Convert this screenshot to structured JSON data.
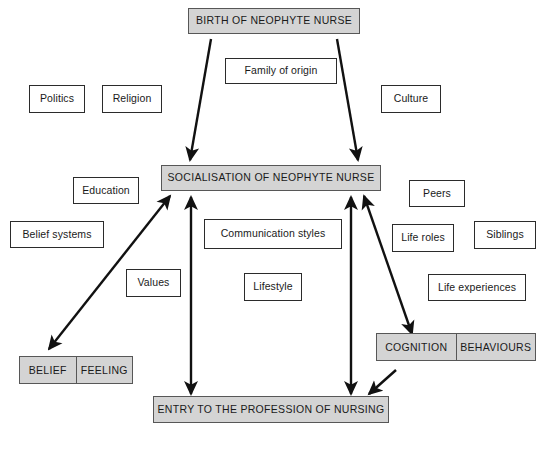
{
  "diagram": {
    "title_text": "Socialisation of the neophyte nurse",
    "background_color": "#ffffff",
    "shaded_fill": "#d4d4d4",
    "outline_color": "#2b2b2b",
    "nodes": {
      "birth": {
        "label": "BIRTH OF NEOPHYTE NURSE"
      },
      "socialisation": {
        "label": "SOCIALISATION OF NEOPHYTE NURSE"
      },
      "entry": {
        "label": "ENTRY TO THE PROFESSION OF NURSING"
      },
      "family_of_origin": {
        "label": "Family of origin"
      },
      "politics": {
        "label": "Politics"
      },
      "religion": {
        "label": "Religion"
      },
      "culture": {
        "label": "Culture"
      },
      "education": {
        "label": "Education"
      },
      "belief_systems": {
        "label": "Belief systems"
      },
      "values": {
        "label": "Values"
      },
      "communication_styles": {
        "label": "Communication styles"
      },
      "lifestyle": {
        "label": "Lifestyle"
      },
      "peers": {
        "label": "Peers"
      },
      "life_roles": {
        "label": "Life roles"
      },
      "siblings": {
        "label": "Siblings"
      },
      "life_experiences": {
        "label": "Life experiences"
      },
      "belief": {
        "label": "BELIEF"
      },
      "feeling": {
        "label": "FEELING"
      },
      "cognition": {
        "label": "COGNITION"
      },
      "behaviours": {
        "label": "BEHAVIOURS"
      }
    }
  }
}
